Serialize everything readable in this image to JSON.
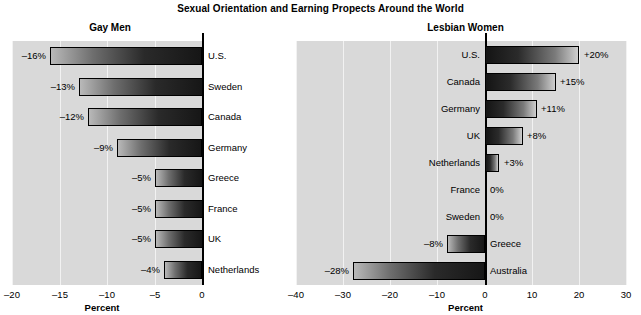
{
  "figure": {
    "title": "Sexual Orientation and Earning Propects Around the World",
    "background_color": "#ffffff",
    "plot_background_color": "#d9d9d9",
    "gridline_color": "#f2f2f2",
    "axis_color": "#000000"
  },
  "panels": [
    {
      "subtitle": "Gay Men",
      "axis_title": "Percent",
      "tick_labels": [
        "–20",
        "–15",
        "–10",
        "–5",
        "0"
      ],
      "tick_values": [
        -20,
        -15,
        -10,
        -5,
        0
      ],
      "categories": [
        "U.S.",
        "Sweden",
        "Canada",
        "Germany",
        "Greece",
        "France",
        "UK",
        "Netherlands"
      ],
      "values": [
        -16,
        -13,
        -12,
        -9,
        -5,
        -5,
        -5,
        -4
      ],
      "value_labels": [
        "–16%",
        "–13%",
        "–12%",
        "–9%",
        "–5%",
        "–5%",
        "–5%",
        "–4%"
      ]
    },
    {
      "subtitle": "Lesbian Women",
      "axis_title": "Percent",
      "tick_labels": [
        "–40",
        "–30",
        "–20",
        "–10",
        "0",
        "10",
        "20",
        "30"
      ],
      "tick_values": [
        -40,
        -30,
        -20,
        -10,
        0,
        10,
        20,
        30
      ],
      "categories": [
        "U.S.",
        "Canada",
        "Germany",
        "UK",
        "Netherlands",
        "France",
        "Sweden",
        "Greece",
        "Australia"
      ],
      "values": [
        20,
        15,
        11,
        8,
        3,
        0,
        0,
        -8,
        -28
      ],
      "value_labels": [
        "+20%",
        "+15%",
        "+11%",
        "+8%",
        "+3%",
        "0%",
        "0%",
        "–8%",
        "–28%"
      ]
    }
  ],
  "chart_data": {
    "type": "bar",
    "title": "Sexual Orientation and Earning Propects Around the World",
    "orientation": "horizontal",
    "xlabel": "Percent",
    "ylabel": "",
    "grid": true,
    "legend": "none",
    "panels": [
      {
        "name": "Gay Men",
        "xlabel": "Percent",
        "xlim": [
          -20,
          0
        ],
        "xticks": [
          -20,
          -15,
          -10,
          -5,
          0
        ],
        "categories": [
          "U.S.",
          "Sweden",
          "Canada",
          "Germany",
          "Greece",
          "France",
          "UK",
          "Netherlands"
        ],
        "values": [
          -16,
          -13,
          -12,
          -9,
          -5,
          -5,
          -5,
          -4
        ],
        "units": "percent"
      },
      {
        "name": "Lesbian Women",
        "xlabel": "Percent",
        "xlim": [
          -40,
          30
        ],
        "xticks": [
          -40,
          -30,
          -20,
          -10,
          0,
          10,
          20,
          30
        ],
        "categories": [
          "U.S.",
          "Canada",
          "Germany",
          "UK",
          "Netherlands",
          "France",
          "Sweden",
          "Greece",
          "Australia"
        ],
        "values": [
          20,
          15,
          11,
          8,
          3,
          0,
          0,
          -8,
          -28
        ],
        "units": "percent"
      }
    ]
  }
}
